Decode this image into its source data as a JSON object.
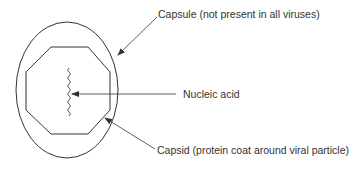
{
  "diagram": {
    "labels": {
      "capsule": "Capsule (not present in all viruses)",
      "nucleic_acid": "Nucleic acid",
      "capsid": "Capsid (protein coat around viral particle)"
    },
    "colors": {
      "stroke": "#333333",
      "text": "#333333",
      "background": "#ffffff"
    }
  }
}
